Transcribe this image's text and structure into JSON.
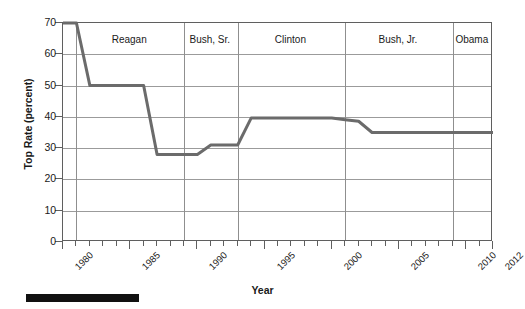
{
  "chart_data": {
    "type": "line",
    "title": "",
    "xlabel": "Year",
    "ylabel": "Top Rate (percent)",
    "xlim": [
      1980,
      2012
    ],
    "ylim": [
      0,
      70
    ],
    "grid": true,
    "legend_position": "none",
    "line_color": "#6b6b6b",
    "x_ticks": [
      1980,
      1985,
      1990,
      1995,
      2000,
      2005,
      2010,
      2012
    ],
    "x_tick_labels": [
      "1980",
      "1985",
      "1990",
      "1995",
      "2000",
      "2005",
      "2010",
      "2012"
    ],
    "y_ticks": [
      0,
      10,
      20,
      30,
      40,
      50,
      60,
      70
    ],
    "y_tick_labels": [
      "0",
      "10",
      "20",
      "30",
      "40",
      "50",
      "60",
      "70"
    ],
    "series": [
      {
        "name": "Top Rate",
        "x": [
          1980,
          1981,
          1982,
          1986,
          1987,
          1990,
          1991,
          1992,
          1993,
          1994,
          2000,
          2001,
          2002,
          2003,
          2012
        ],
        "values": [
          70,
          70,
          50,
          50,
          28,
          28,
          31,
          31,
          31,
          39.6,
          39.6,
          39.1,
          38.6,
          35,
          35
        ]
      }
    ],
    "annotations": [
      {
        "label": "Reagan",
        "start_year": 1981,
        "end_year": 1989
      },
      {
        "label": "Bush, Sr.",
        "start_year": 1989,
        "end_year": 1993
      },
      {
        "label": "Clinton",
        "start_year": 1993,
        "end_year": 2001
      },
      {
        "label": "Bush, Jr.",
        "start_year": 2001,
        "end_year": 2009
      },
      {
        "label": "Obama",
        "start_year": 2009,
        "end_year": 2012
      }
    ],
    "era_dividers": [
      1981,
      1989,
      1993,
      2001,
      2009
    ]
  },
  "axes": {
    "x_label": "Year",
    "y_label": "Top Rate (percent)"
  },
  "eras": [
    {
      "label": "Reagan"
    },
    {
      "label": "Bush, Sr."
    },
    {
      "label": "Clinton"
    },
    {
      "label": "Bush, Jr."
    },
    {
      "label": "Obama"
    }
  ],
  "ytick_labels": [
    "70",
    "60",
    "50",
    "40",
    "30",
    "20",
    "10",
    "0"
  ],
  "xtick_labels": [
    "1980",
    "1985",
    "1990",
    "1995",
    "2000",
    "2005",
    "2010",
    "2012"
  ],
  "caption": ""
}
